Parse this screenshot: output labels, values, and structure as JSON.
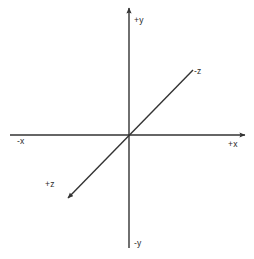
{
  "diagram": {
    "type": "coordinate-axes",
    "canvas": {
      "width": 254,
      "height": 259,
      "background": "#ffffff"
    },
    "origin": {
      "x": 129,
      "y": 135
    },
    "stroke_color": "#333333",
    "text_color": "#2b2b2b",
    "stroke_width": 1.4,
    "axes": [
      {
        "name": "y-axis",
        "orientation": "vertical",
        "from": {
          "x": 129,
          "y": 248
        },
        "to": {
          "x": 129,
          "y": 6
        },
        "arrow_at": "to",
        "positive_label": "+y",
        "negative_label": "-y"
      },
      {
        "name": "x-axis",
        "orientation": "horizontal",
        "from": {
          "x": 10,
          "y": 135
        },
        "to": {
          "x": 247,
          "y": 135
        },
        "arrow_at": "to",
        "positive_label": "+x",
        "negative_label": "-x"
      },
      {
        "name": "z-axis",
        "orientation": "diagonal",
        "from": {
          "x": 193,
          "y": 70
        },
        "to": {
          "x": 66,
          "y": 200
        },
        "arrow_at": "to",
        "positive_label": "+z",
        "negative_label": "-z"
      }
    ],
    "labels": [
      {
        "id": "plus-y",
        "text": "+y",
        "x": 134,
        "y": 16
      },
      {
        "id": "minus-z",
        "text": "-z",
        "x": 194,
        "y": 67
      },
      {
        "id": "plus-x",
        "text": "+x",
        "x": 228,
        "y": 140
      },
      {
        "id": "minus-x",
        "text": "-x",
        "x": 17,
        "y": 137
      },
      {
        "id": "plus-z",
        "text": "+z",
        "x": 45,
        "y": 180
      },
      {
        "id": "minus-y",
        "text": "-y",
        "x": 134,
        "y": 239
      }
    ]
  }
}
